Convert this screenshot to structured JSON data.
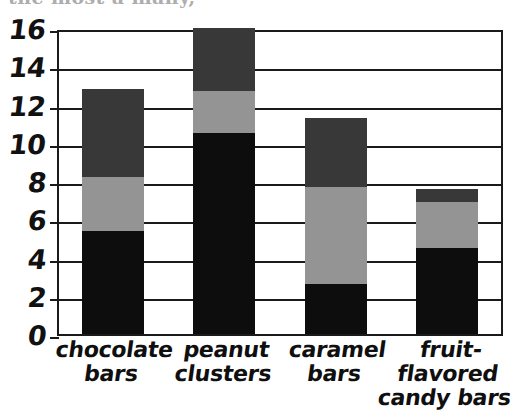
{
  "page": {
    "top_cut_text": "the most a many,",
    "background_color": "#ffffff"
  },
  "chart_data": {
    "type": "bar",
    "subtype": "stacked-bar",
    "title": "",
    "xlabel": "",
    "ylabel": "",
    "ylim": [
      0,
      16
    ],
    "yticks": [
      0,
      2,
      4,
      6,
      8,
      10,
      12,
      14,
      16
    ],
    "ytick_labels": [
      "0",
      "2",
      "4",
      "6",
      "8",
      "10",
      "12",
      "14",
      "16"
    ],
    "grid": true,
    "grid_axis": "y",
    "legend": false,
    "legend_position": "none",
    "categories": [
      "chocolate\nbars",
      "peanut\nclusters",
      "caramel\nbars",
      "fruit-flavored\ncandy bars"
    ],
    "category_labels_plain": [
      "chocolate bars",
      "peanut clusters",
      "caramel bars",
      "fruit-flavored candy bars"
    ],
    "series": [
      {
        "name": "bottom-segment",
        "color": "#0d0d0d",
        "values": [
          5.4,
          10.5,
          2.6,
          4.5
        ]
      },
      {
        "name": "middle-segment",
        "color": "#949494",
        "values": [
          2.8,
          2.2,
          5.1,
          2.4
        ]
      },
      {
        "name": "top-segment",
        "color": "#383838",
        "values": [
          4.6,
          3.3,
          3.6,
          0.7
        ]
      }
    ],
    "cumulative_tops": [
      [
        5.4,
        8.2,
        12.8
      ],
      [
        10.5,
        12.7,
        16.0
      ],
      [
        2.6,
        7.7,
        11.3
      ],
      [
        4.5,
        6.9,
        7.6
      ]
    ],
    "totals": [
      12.8,
      16.0,
      11.3,
      7.6
    ]
  }
}
